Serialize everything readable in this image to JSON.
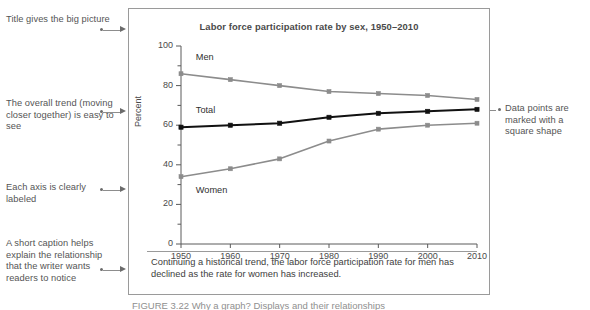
{
  "figure": {
    "title": "Labor force participation rate by sex, 1950–2010",
    "caption": "Continuing a historical trend, the labor force participation rate for men has declined as the rate for women has increased.",
    "bottom_clipped_text": "FIGURE 3.22 Why a graph? Displays and their relationships"
  },
  "annotations": {
    "left": [
      {
        "id": "title-note",
        "text": "Title gives the big picture"
      },
      {
        "id": "trend-note",
        "text": "The overall trend (moving closer together) is easy to see"
      },
      {
        "id": "axis-note",
        "text": "Each axis is clearly labeled"
      },
      {
        "id": "caption-note",
        "text": "A short caption helps explain the relationship that the writer wants readers to notice"
      }
    ],
    "right": [
      {
        "id": "marker-note",
        "text": "Data points are marked with a square shape"
      }
    ]
  },
  "chart_data": {
    "type": "line",
    "title": "Labor force participation rate by sex, 1950–2010",
    "xlabel": "",
    "ylabel": "Percent",
    "categories": [
      1950,
      1960,
      1970,
      1980,
      1990,
      2000,
      2010
    ],
    "xticklabels": [
      "1950",
      "1960",
      "1970",
      "1980",
      "1990",
      "2000",
      "2010"
    ],
    "yticklabels": [
      "0",
      "20",
      "40",
      "60",
      "80",
      "100"
    ],
    "yticks": [
      0,
      20,
      40,
      60,
      80,
      100
    ],
    "ylim": [
      0,
      100
    ],
    "xlim": [
      1950,
      2010
    ],
    "grid": false,
    "legend": "inline-labels",
    "marker": "square",
    "series": [
      {
        "name": "Men",
        "color": "#8c8c8c",
        "label_x": 1953,
        "label_y": 94,
        "values": [
          86,
          83,
          80,
          77,
          76,
          75,
          73
        ]
      },
      {
        "name": "Total",
        "color": "#111111",
        "label_x": 1953,
        "label_y": 67,
        "values": [
          59,
          60,
          61,
          64,
          66,
          67,
          68
        ]
      },
      {
        "name": "Women",
        "color": "#8c8c8c",
        "label_x": 1953,
        "label_y": 27,
        "values": [
          34,
          38,
          43,
          52,
          58,
          60,
          61
        ]
      }
    ]
  }
}
